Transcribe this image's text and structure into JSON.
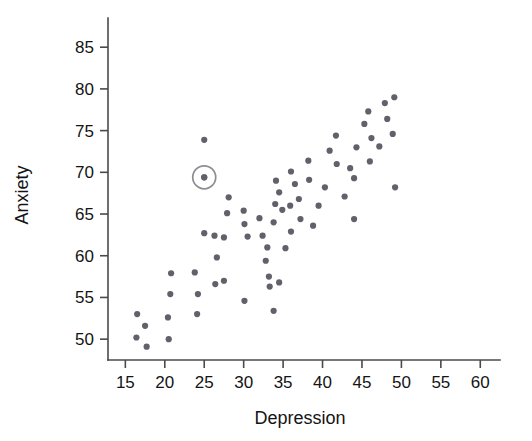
{
  "chart_data": {
    "type": "scatter",
    "title": "",
    "xlabel": "Depression",
    "ylabel": "Anxiety",
    "xlim": [
      12.8,
      62.5
    ],
    "ylim": [
      47.5,
      88.5
    ],
    "xticks": [
      15,
      20,
      25,
      30,
      35,
      40,
      45,
      50,
      55,
      60
    ],
    "yticks": [
      50,
      55,
      60,
      65,
      70,
      75,
      80,
      85
    ],
    "grid": false,
    "legend": null,
    "point_color": "#60616a",
    "axis_color": "#4a4a4a",
    "point_radius": 3.1,
    "highlight": {
      "x": 25.0,
      "y": 69.4,
      "ring_radius": 11.5,
      "ring_color": "#8d8d93",
      "label": "circled-outlier-point"
    },
    "n_points": 68,
    "points": [
      [
        16.5,
        53.0
      ],
      [
        17.5,
        51.6
      ],
      [
        16.4,
        50.2
      ],
      [
        17.7,
        49.1
      ],
      [
        20.8,
        57.9
      ],
      [
        20.7,
        55.4
      ],
      [
        20.5,
        50.0
      ],
      [
        20.4,
        52.6
      ],
      [
        24.2,
        55.4
      ],
      [
        23.8,
        58.0
      ],
      [
        24.1,
        53.0
      ],
      [
        26.3,
        62.4
      ],
      [
        25.0,
        62.7
      ],
      [
        27.5,
        62.2
      ],
      [
        26.6,
        59.8
      ],
      [
        26.4,
        56.6
      ],
      [
        27.5,
        57.0
      ],
      [
        25.0,
        73.9
      ],
      [
        25.0,
        69.4
      ],
      [
        28.1,
        67.0
      ],
      [
        27.9,
        65.1
      ],
      [
        30.0,
        65.4
      ],
      [
        30.1,
        63.8
      ],
      [
        30.5,
        62.3
      ],
      [
        30.1,
        54.6
      ],
      [
        32.0,
        64.5
      ],
      [
        32.4,
        62.4
      ],
      [
        33.0,
        61.0
      ],
      [
        32.8,
        59.4
      ],
      [
        33.2,
        57.5
      ],
      [
        33.3,
        56.3
      ],
      [
        34.1,
        69.0
      ],
      [
        34.5,
        67.6
      ],
      [
        34.0,
        66.2
      ],
      [
        33.8,
        64.0
      ],
      [
        34.9,
        65.5
      ],
      [
        36.0,
        70.1
      ],
      [
        36.5,
        68.6
      ],
      [
        35.9,
        66.0
      ],
      [
        36.0,
        62.9
      ],
      [
        35.3,
        60.9
      ],
      [
        34.5,
        56.8
      ],
      [
        33.8,
        53.4
      ],
      [
        38.2,
        71.4
      ],
      [
        38.3,
        69.1
      ],
      [
        37.0,
        66.8
      ],
      [
        37.2,
        64.4
      ],
      [
        38.8,
        63.6
      ],
      [
        39.5,
        66.0
      ],
      [
        40.9,
        72.6
      ],
      [
        41.8,
        71.0
      ],
      [
        41.7,
        74.4
      ],
      [
        40.3,
        68.2
      ],
      [
        42.8,
        67.1
      ],
      [
        43.5,
        70.5
      ],
      [
        44.0,
        69.3
      ],
      [
        44.3,
        73.0
      ],
      [
        44.0,
        64.4
      ],
      [
        45.8,
        77.3
      ],
      [
        45.3,
        75.8
      ],
      [
        46.2,
        74.1
      ],
      [
        46.0,
        71.3
      ],
      [
        47.2,
        73.1
      ],
      [
        47.9,
        78.3
      ],
      [
        48.2,
        76.4
      ],
      [
        49.1,
        79.0
      ],
      [
        48.9,
        74.6
      ],
      [
        49.2,
        68.2
      ]
    ]
  },
  "axes": {
    "x_tick_labels": [
      "15",
      "20",
      "25",
      "30",
      "35",
      "40",
      "45",
      "50",
      "55",
      "60"
    ],
    "y_tick_labels": [
      "50",
      "55",
      "60",
      "65",
      "70",
      "75",
      "80",
      "85"
    ],
    "x_axis_title": "Depression",
    "y_axis_title": "Anxiety"
  }
}
